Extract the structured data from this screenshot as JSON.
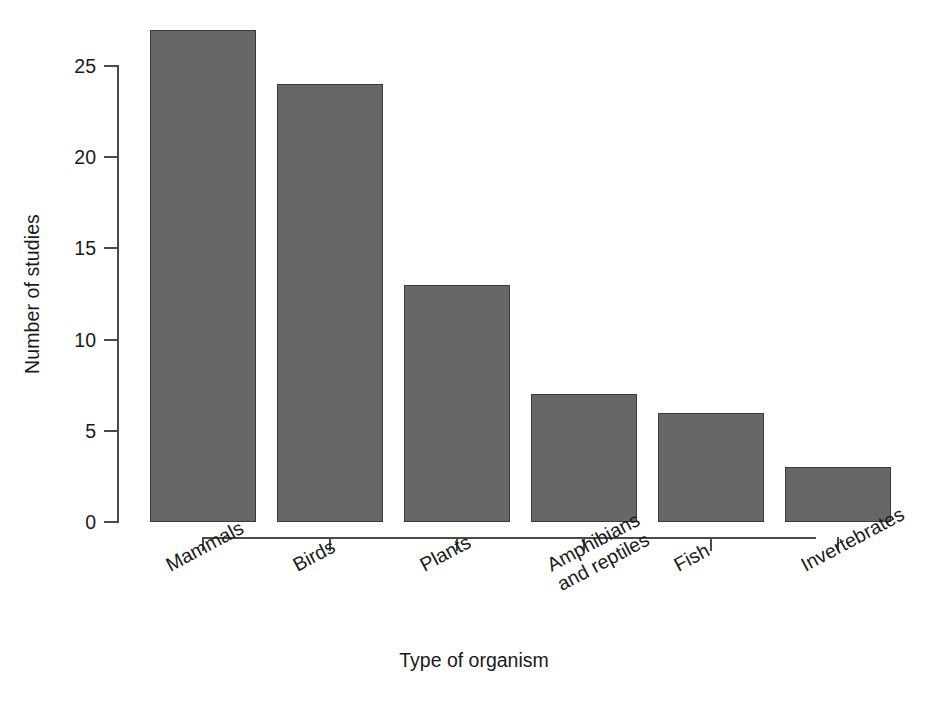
{
  "chart_data": {
    "type": "bar",
    "title": "",
    "subtitle": "",
    "xlabel": "Type of organism",
    "ylabel": "Number of studies",
    "categories": [
      "Mammals",
      "Birds",
      "Plants",
      "Amphibians\nand reptiles",
      "Fish",
      "Invertebrates"
    ],
    "category_lines": [
      [
        "Mammals"
      ],
      [
        "Birds"
      ],
      [
        "Plants"
      ],
      [
        "Amphibians",
        "and reptiles"
      ],
      [
        "Fish"
      ],
      [
        "Invertebrates"
      ]
    ],
    "values": [
      27,
      24,
      13,
      7,
      6,
      3
    ],
    "ylim": [
      0,
      27.5
    ],
    "yticks": [
      0,
      5,
      10,
      15,
      20,
      25
    ],
    "ytick_labels": [
      "0",
      "5",
      "10",
      "15",
      "20",
      "25"
    ],
    "grid": false,
    "legend": "none",
    "bar_fill_color": "#676767",
    "bar_border_color": "#3a3a3a",
    "axis_color": "#4a4a4a",
    "background_color": "#ffffff",
    "label_rotation_degrees": -28
  }
}
